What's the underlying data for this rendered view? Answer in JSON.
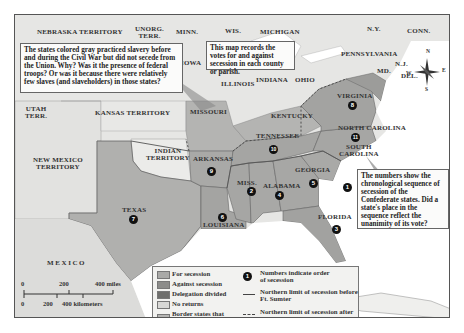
{
  "map": {
    "colors": {
      "for_secession": "#a9a9a7",
      "against_secession": "#8c8c8a",
      "delegation_divided": "#6e6e6c",
      "no_returns": "#d8d8d6",
      "border_states": "#b6b6b4",
      "free_states": "#eeeeec",
      "territory": "#e4e4e2",
      "water": "#ffffff"
    },
    "labels": {
      "nebraska": "NEBRASKA TERRITORY",
      "unorg": "UNORG.\nTERR.",
      "minn": "MINN.",
      "wis": "WIS.",
      "michigan": "MICHIGAN",
      "ny": "N.Y.",
      "conn": "CONN.",
      "pennsylvania": "PENNSYLVANIA",
      "nj": "N.J.",
      "md": "MD.",
      "del": "DEL.",
      "iowa": "IOWA",
      "illinois": "ILLINOIS",
      "indiana": "INDIANA",
      "ohio": "OHIO",
      "virginia": "VIRGINIA",
      "utah": "UTAH\nTERR.",
      "kansas": "KANSAS TERRITORY",
      "missouri": "MISSOURI",
      "kentucky": "KENTUCKY",
      "north_carolina": "NORTH CAROLINA",
      "tennessee": "TENNESSEE",
      "south_carolina": "SOUTH\nCAROLINA",
      "indian_territory": "INDIAN\nTERRITORY",
      "arkansas": "ARKANSAS",
      "new_mexico": "NEW MEXICO\nTERRITORY",
      "miss": "MISS.",
      "alabama": "ALABAMA",
      "georgia": "GEORGIA",
      "texas": "TEXAS",
      "louisiana": "LOUISIANA",
      "florida": "FLORIDA",
      "mexico": "MEXICO"
    },
    "secession_order": {
      "south_carolina": "1",
      "mississippi": "2",
      "florida": "3",
      "alabama": "4",
      "georgia": "5",
      "louisiana": "6",
      "texas": "7",
      "virginia": "8",
      "arkansas": "9",
      "tennessee": "10",
      "north_carolina": "11"
    },
    "callouts": {
      "gray_states": "The states colored gray practiced slavery before and during the Civil War but did not secede from the Union. Why? Was it the presence of federal troops? Or was it because there were relatively few slaves (and slaveholders) in those states?",
      "votes": "This map records the votes for and against secession in each county or parish.",
      "numbers": "The numbers show the chronological sequence of secession of the Confederate states. Did a state's place in the sequence reflect the unanimity of its vote?"
    },
    "compass": {
      "n": "N",
      "e": "E",
      "s": "S",
      "w": "W"
    },
    "scale": {
      "miles": [
        "0",
        "200",
        "400 miles"
      ],
      "km": [
        "0",
        "200",
        "400 kilometers"
      ]
    },
    "legend": {
      "items": [
        {
          "label": "For secession",
          "color_key": "for_secession"
        },
        {
          "label": "Against secession",
          "color_key": "against_secession"
        },
        {
          "label": "Delegation divided",
          "color_key": "delegation_divided"
        },
        {
          "label": "No returns",
          "color_key": "no_returns"
        },
        {
          "label": "Border states that did not secede",
          "color_key": "border_states"
        }
      ],
      "numbers_label": "Numbers indicate order of secession",
      "numbers_example": "1",
      "solid_line_label": "Northern limit of secession before Ft. Sumter",
      "dashed_line_label": "Northern limit of secession after Ft. Sumter"
    }
  }
}
